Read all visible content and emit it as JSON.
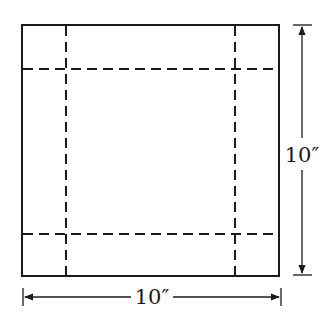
{
  "diagram": {
    "square": {
      "x": 22,
      "y": 25,
      "size_w": 257,
      "size_h": 251
    },
    "fold_lines": {
      "vertical_x": [
        66,
        235
      ],
      "horizontal_y": [
        69,
        234
      ],
      "style": "dashed"
    },
    "dimensions": {
      "width_label": "10″",
      "height_label": "10″"
    },
    "colors": {
      "stroke": "#1a1a1a",
      "background": "#ffffff"
    }
  }
}
